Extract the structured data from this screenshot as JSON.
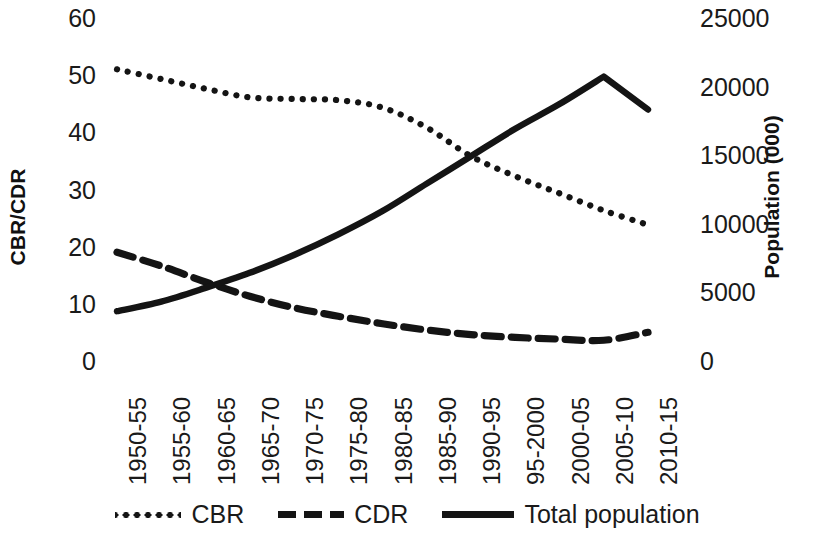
{
  "chart_data": {
    "type": "line",
    "title": "",
    "subtitle": "",
    "xlabel": "",
    "ylabel": "CBR/CDR",
    "y2label": "Population (000)",
    "ylim": [
      0,
      60
    ],
    "y2lim": [
      0,
      25000
    ],
    "ytick_labels": [
      "60",
      "50",
      "40",
      "30",
      "20",
      "10",
      "0"
    ],
    "ytick_values": [
      60,
      50,
      40,
      30,
      20,
      10,
      0
    ],
    "y2tick_labels": [
      "25000",
      "20000",
      "15000",
      "10000",
      "5000",
      "0"
    ],
    "y2tick_values": [
      25000,
      20000,
      15000,
      10000,
      5000,
      0
    ],
    "grid": false,
    "legend_position": "bottom",
    "categories": [
      "1950-55",
      "1955-60",
      "1960-65",
      "1965-70",
      "1970-75",
      "1975-80",
      "1980-85",
      "1985-90",
      "1990-95",
      "95-2000",
      "2000-05",
      "2005-10",
      "2010-15"
    ],
    "series": [
      {
        "name": "CBR",
        "axis": "left",
        "style": "dotted",
        "color": "#141414",
        "values": [
          51.2,
          49.5,
          47.8,
          46.3,
          46.0,
          45.8,
          44.5,
          41.0,
          36.0,
          32.5,
          29.5,
          26.5,
          24.0
        ]
      },
      {
        "name": "CDR",
        "axis": "left",
        "style": "dashed",
        "color": "#141414",
        "values": [
          19.2,
          16.8,
          14.0,
          11.5,
          9.5,
          8.0,
          6.7,
          5.6,
          4.8,
          4.3,
          4.0,
          3.8,
          5.2
        ]
      },
      {
        "name": "Total population",
        "axis": "right",
        "style": "solid",
        "color": "#141414",
        "values": [
          3700,
          4400,
          5400,
          6500,
          7800,
          9300,
          11000,
          13000,
          15000,
          17000,
          18800,
          20800,
          18400
        ]
      }
    ]
  },
  "legend": {
    "items": [
      {
        "label": "CBR",
        "style": "dotted"
      },
      {
        "label": "CDR",
        "style": "dashed"
      },
      {
        "label": "Total population",
        "style": "solid"
      }
    ]
  }
}
